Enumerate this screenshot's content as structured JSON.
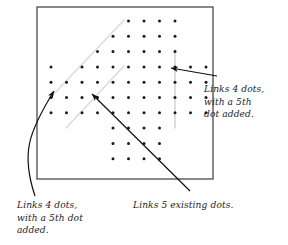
{
  "diagram": {
    "type": "dot-lattice-annotated-figure",
    "title_visible": false,
    "frame": {
      "name": "square-border",
      "x": 37,
      "y": 7,
      "width": 176,
      "height": 172,
      "stroke": "#3b3b3b",
      "stroke_width": 1.2,
      "fill": "#ffffff"
    },
    "lattice": {
      "description": "Diamond (rhombus) shaped array of small black dots on a regular square grid",
      "dot_color": "#1a1a1a",
      "dot_radius": 1.5,
      "spacing_x": 15.5,
      "spacing_y": 15.3,
      "origin_x": 51,
      "origin_y": 21,
      "rows": [
        {
          "row": 0,
          "cols": [
            5,
            6,
            7,
            8
          ]
        },
        {
          "row": 1,
          "cols": [
            4,
            5,
            6,
            7,
            8
          ]
        },
        {
          "row": 2,
          "cols": [
            3,
            4,
            5,
            6,
            7,
            8
          ]
        },
        {
          "row": 3,
          "cols": [
            0,
            2,
            3,
            4,
            5,
            6,
            7,
            8,
            9,
            10
          ]
        },
        {
          "row": 4,
          "cols": [
            0,
            1,
            2,
            3,
            4,
            5,
            6,
            7,
            8,
            9,
            10
          ]
        },
        {
          "row": 5,
          "cols": [
            0,
            1,
            2,
            3,
            4,
            5,
            6,
            7,
            8,
            9,
            10
          ]
        },
        {
          "row": 6,
          "cols": [
            0,
            1,
            2,
            3,
            4,
            5,
            6,
            7,
            8,
            9,
            10
          ]
        },
        {
          "row": 7,
          "cols": [
            4,
            5,
            6,
            7
          ]
        },
        {
          "row": 8,
          "cols": [
            4,
            5,
            6,
            7
          ]
        },
        {
          "row": 9,
          "cols": [
            4,
            5,
            6,
            7
          ]
        }
      ]
    },
    "links": [
      {
        "name": "upper-diagonal-link",
        "orientation": "diagonal",
        "color": "#dcdcdc",
        "stroke_width": 1.6,
        "x1": 124,
        "y1": 20,
        "x2": 51,
        "y2": 97,
        "dots_linked": 4,
        "added_dots": 1
      },
      {
        "name": "lower-diagonal-link",
        "orientation": "diagonal",
        "color": "#dcdcdc",
        "stroke_width": 1.6,
        "x1": 124,
        "y1": 66,
        "x2": 66,
        "y2": 128,
        "dots_linked": 4,
        "added_dots": 1
      },
      {
        "name": "vertical-link",
        "orientation": "vertical",
        "color": "#cfcfcf",
        "stroke_width": 1.4,
        "x1": 175,
        "y1": 50,
        "x2": 175,
        "y2": 128,
        "dots_linked": 5,
        "added_dots": 0
      }
    ],
    "arrows": [
      {
        "name": "arrow-to-upper-diagonal",
        "style": "curved",
        "color": "#111111",
        "tail_x": 35,
        "tail_y": 196,
        "head_x": 54,
        "head_y": 91
      },
      {
        "name": "arrow-to-lower-diagonal",
        "style": "straight",
        "color": "#111111",
        "tail_x": 190,
        "tail_y": 191,
        "head_x": 92,
        "head_y": 94
      },
      {
        "name": "arrow-to-vertical-link",
        "style": "straight",
        "color": "#111111",
        "tail_x": 217,
        "tail_y": 76,
        "head_x": 171,
        "head_y": 68
      }
    ]
  },
  "annotations": {
    "right": {
      "name": "annotation-right",
      "lines": [
        "Links 4 dots,",
        "with a 5th",
        "dot added."
      ]
    },
    "bottom_left": {
      "name": "annotation-bottom-left",
      "lines": [
        "Links 4 dots,",
        "with a 5th dot",
        "added."
      ]
    },
    "bottom_center": {
      "name": "annotation-bottom-center",
      "lines": [
        "Links 5 existing dots."
      ]
    }
  },
  "colors": {
    "ink": "#1c1c1c",
    "frame": "#3b3b3b",
    "dot": "#1a1a1a",
    "link_light": "#dcdcdc",
    "link_vertical": "#cfcfcf",
    "background": "#ffffff"
  }
}
